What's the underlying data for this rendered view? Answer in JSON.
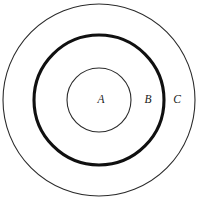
{
  "figure": {
    "type": "concentric-circle-diagram",
    "canvas": {
      "width": 199,
      "height": 200,
      "background": "#ffffff"
    },
    "center": {
      "x": 99,
      "y": 100
    },
    "circles": [
      {
        "id": "circle-c",
        "label": "C",
        "radius": 96,
        "stroke_width": 1.1,
        "stroke_color": "#2b2b2b",
        "fill": "none",
        "emphasis": "thin"
      },
      {
        "id": "circle-b",
        "label": "B",
        "radius": 65,
        "stroke_width": 3.1,
        "stroke_color": "#101010",
        "fill": "none",
        "emphasis": "bold"
      },
      {
        "id": "circle-a",
        "label": "A",
        "radius": 32,
        "stroke_width": 1.1,
        "stroke_color": "#2b2b2b",
        "fill": "none",
        "emphasis": "thin"
      }
    ],
    "labels": [
      {
        "id": "label-a",
        "text": "A",
        "x": 101,
        "y": 100,
        "region": "innermost disc"
      },
      {
        "id": "label-b",
        "text": "B",
        "x": 148,
        "y": 100,
        "region": "annulus between A and B"
      },
      {
        "id": "label-c",
        "text": "C",
        "x": 177,
        "y": 100,
        "region": "annulus between B and C"
      }
    ]
  },
  "chart_data": {
    "type": "diagram",
    "subtitle": "",
    "xlabel": "",
    "ylabel": "",
    "legend": [],
    "annotations": [
      "A",
      "B",
      "C"
    ],
    "series": [
      {
        "name": "A",
        "radius": 32,
        "stroke_width": 1.1
      },
      {
        "name": "B",
        "radius": 65,
        "stroke_width": 3.1
      },
      {
        "name": "C",
        "radius": 96,
        "stroke_width": 1.1
      }
    ],
    "grid": false
  }
}
